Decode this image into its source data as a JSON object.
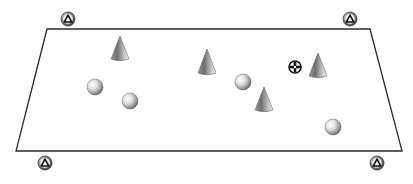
{
  "scene": {
    "width": 413,
    "height": 184,
    "background": "#ffffff",
    "plane": {
      "corners": [
        [
          47,
          29
        ],
        [
          370,
          29
        ],
        [
          402,
          151
        ],
        [
          16,
          151
        ]
      ],
      "stroke": "#2a2a2a"
    },
    "corner_markers": [
      {
        "name": "marker-top-left",
        "cx": 68,
        "cy": 19,
        "r": 7
      },
      {
        "name": "marker-top-right",
        "cx": 350,
        "cy": 19,
        "r": 7
      },
      {
        "name": "marker-bottom-left",
        "cx": 45,
        "cy": 163,
        "r": 7
      },
      {
        "name": "marker-bottom-right",
        "cx": 377,
        "cy": 163,
        "r": 7
      }
    ],
    "cones": [
      {
        "name": "cone-1",
        "apex": [
          120,
          36
        ],
        "base_y": 59,
        "half_width": 9
      },
      {
        "name": "cone-2",
        "apex": [
          207,
          49
        ],
        "base_y": 73,
        "half_width": 9
      },
      {
        "name": "cone-3",
        "apex": [
          318,
          53
        ],
        "base_y": 76,
        "half_width": 9
      },
      {
        "name": "cone-4",
        "apex": [
          264,
          87
        ],
        "base_y": 110,
        "half_width": 9
      }
    ],
    "spheres": [
      {
        "name": "sphere-1",
        "cx": 95,
        "cy": 87,
        "r": 8
      },
      {
        "name": "sphere-2",
        "cx": 130,
        "cy": 101,
        "r": 8
      },
      {
        "name": "sphere-3",
        "cx": 243,
        "cy": 82,
        "r": 8
      },
      {
        "name": "sphere-4",
        "cx": 333,
        "cy": 127,
        "r": 8
      }
    ],
    "target_marker": {
      "name": "target-crosshair",
      "cx": 295,
      "cy": 67,
      "r": 6
    }
  }
}
